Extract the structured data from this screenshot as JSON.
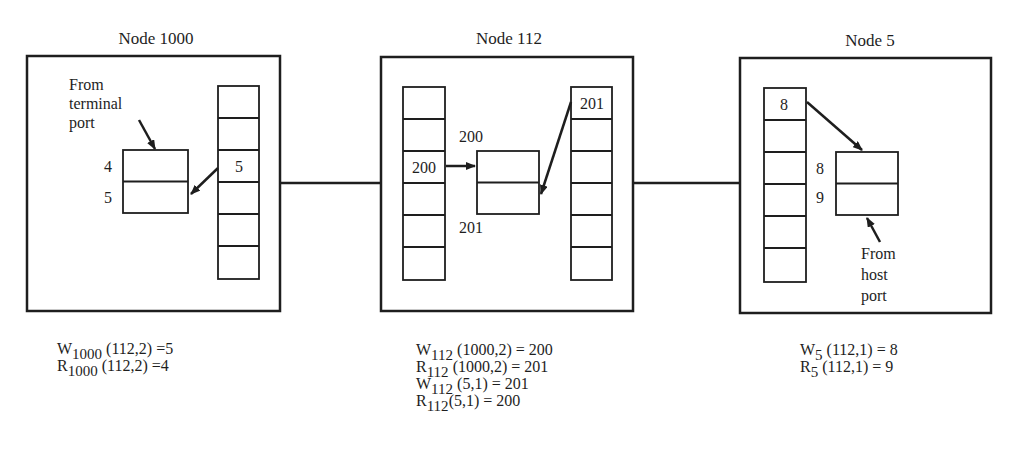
{
  "nodes": [
    {
      "id": "node-1000",
      "title": "Node 1000",
      "annotation": [
        "From",
        "terminal",
        "port"
      ],
      "column_cells": [
        "",
        "",
        "5",
        "",
        "",
        ""
      ],
      "pair_box_labels": [
        "4",
        "5"
      ],
      "formulas": [
        {
          "var": "W",
          "sub": "1000",
          "args": " (112,2) =5"
        },
        {
          "var": "R",
          "sub": "1000",
          "args": " (112,2) =4"
        }
      ]
    },
    {
      "id": "node-112",
      "title": "Node 112",
      "left_column_cells": [
        "",
        "",
        "200",
        "",
        "",
        ""
      ],
      "right_column_cells": [
        "201",
        "",
        "",
        "",
        "",
        ""
      ],
      "pair_box_labels": [
        "200",
        "201"
      ],
      "formulas": [
        {
          "var": "W",
          "sub": "112",
          "args": " (1000,2) = 200"
        },
        {
          "var": "R",
          "sub": "112",
          "args": " (1000,2) = 201"
        },
        {
          "var": "W",
          "sub": "112",
          "args": " (5,1) = 201"
        },
        {
          "var": "R",
          "sub": "112",
          "args": "(5,1) = 200"
        }
      ]
    },
    {
      "id": "node-5",
      "title": "Node 5",
      "annotation": [
        "From",
        "host",
        "port"
      ],
      "column_cells": [
        "8",
        "",
        "",
        "",
        "",
        ""
      ],
      "pair_box_labels": [
        "8",
        "9"
      ],
      "formulas": [
        {
          "var": "W",
          "sub": "5",
          "args": " (112,1) = 8"
        },
        {
          "var": "R",
          "sub": "5",
          "args": " (112,1) = 9"
        }
      ]
    }
  ],
  "colors": {
    "stroke": "#1e1e1e",
    "background": "#ffffff"
  }
}
